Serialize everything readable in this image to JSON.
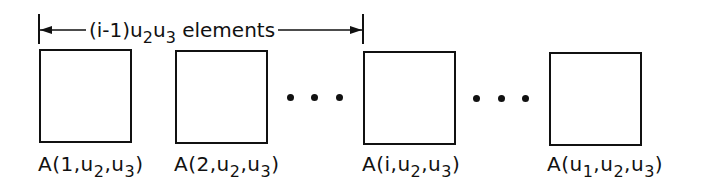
{
  "dimension": {
    "prefix": "(i-1)u",
    "sub1": "2",
    "mid": "u",
    "sub2": "3",
    "suffix": " elements"
  },
  "blocks": [
    {
      "label_pre": "A(1,u",
      "s1": "2",
      "mid": ",u",
      "s2": "3",
      "post": ")"
    },
    {
      "label_pre": "A(2,u",
      "s1": "2",
      "mid": ",u",
      "s2": "3",
      "post": ")"
    },
    {
      "label_pre": "A(i,u",
      "s1": "2",
      "mid": ",u",
      "s2": "3",
      "post": ")"
    },
    {
      "label_pre": "A(u",
      "s0": "1",
      "label_pre2": ",u",
      "s1": "2",
      "mid": ",u",
      "s2": "3",
      "post": ")"
    }
  ],
  "ellipsis": [
    "...",
    "..."
  ]
}
